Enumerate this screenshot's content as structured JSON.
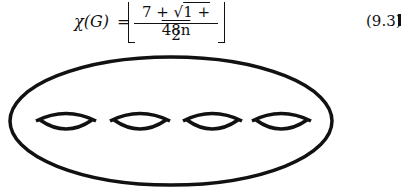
{
  "equation": {
    "lhs": "χ(G)",
    "eq_sign": "=",
    "numerator_prefix": "7 + √",
    "numerator_radicand": "1 + 48n",
    "denominator": "2",
    "number": "(9.3)"
  },
  "figure": {
    "hole_count": 4,
    "stroke_color": "#111111"
  }
}
